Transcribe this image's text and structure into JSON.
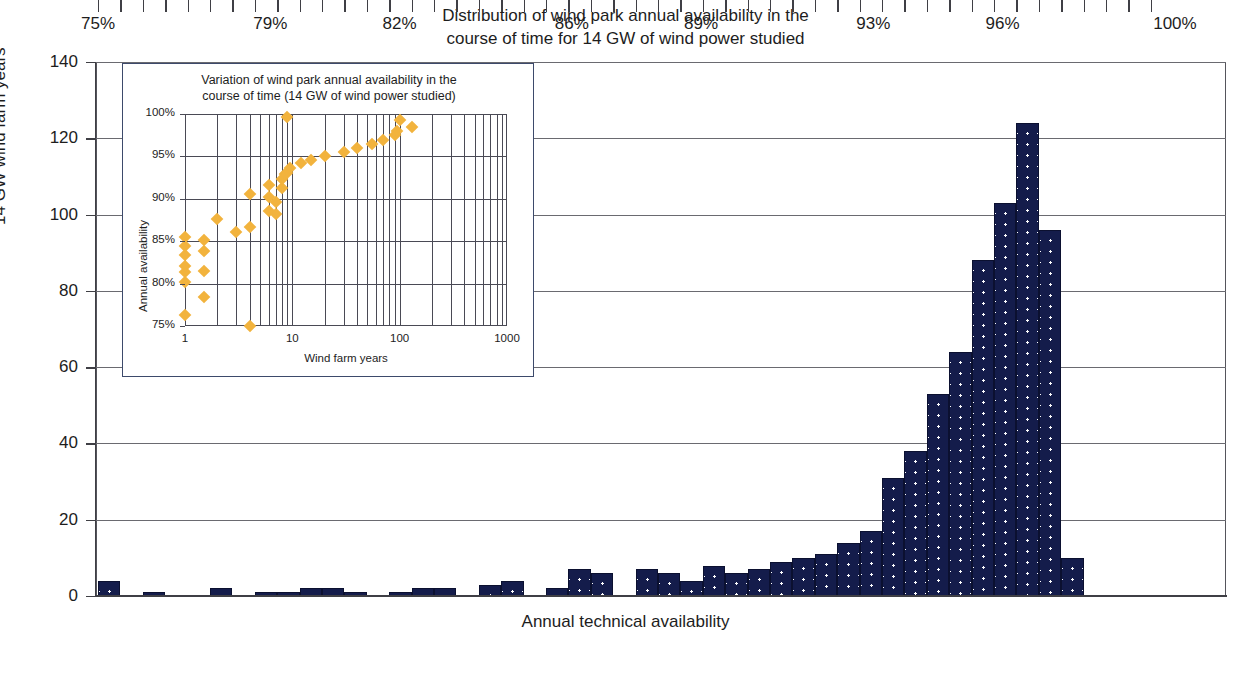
{
  "main": {
    "title_line1": "Distribution of wind park annual availability in the",
    "title_line2": "course of time for 14 GW of wind power studied",
    "y_title": "14 GW wind farm years",
    "x_title": "Annual technical availability"
  },
  "inset": {
    "title_line1": "Variation of wind park annual availability in the",
    "title_line2": "course of time (14 GW of wind power studied)",
    "y_title": "Annual availability",
    "x_title": "Wind farm years"
  },
  "colors": {
    "bar_fill": "#141c4b",
    "bar_dot": "#ffffff",
    "scatter": "#f2b33d",
    "axis": "#3f3f45",
    "inset_border": "#3d4a6b"
  },
  "chart_data": [
    {
      "type": "bar",
      "title": "Distribution of wind park annual availability in the course of time for 14 GW of wind power studied",
      "xlabel": "Annual technical availability",
      "ylabel": "14 GW wind farm years",
      "ylim": [
        0,
        140
      ],
      "ytick_labels": [
        "0",
        "20",
        "40",
        "60",
        "80",
        "100",
        "120",
        "140"
      ],
      "ytick_values": [
        0,
        20,
        40,
        60,
        80,
        100,
        120,
        140
      ],
      "xlim": [
        74.5,
        100.5
      ],
      "xtick_labels": [
        "75%",
        "79%",
        "82%",
        "86%",
        "89%",
        "93%",
        "96%",
        "100%"
      ],
      "xtick_values": [
        75,
        79,
        82,
        86,
        89,
        93,
        96,
        100
      ],
      "grid": "horizontal",
      "legend": "none",
      "bin_width_percent": 0.52,
      "categories": [
        "75%",
        "75.5%",
        "76%",
        "76.5%",
        "77%",
        "77.5%",
        "78%",
        "78.5%",
        "79%",
        "79.5%",
        "80%",
        "80.5%",
        "81%",
        "81.5%",
        "82%",
        "82.5%",
        "83%",
        "83.5%",
        "84%",
        "84.5%",
        "85%",
        "85.5%",
        "86%",
        "86.5%",
        "87%",
        "87.5%",
        "88%",
        "88.5%",
        "89%",
        "89.5%",
        "90%",
        "90.5%",
        "91%",
        "91.5%",
        "92%",
        "92.5%",
        "93%",
        "93.5%",
        "94%",
        "94.5%",
        "95%",
        "95.5%",
        "96%",
        "96.5%",
        "97%",
        "97.5%",
        "98%",
        "98.5%",
        "99%",
        "99.5%",
        "100%"
      ],
      "values": [
        4,
        0,
        1,
        0,
        0,
        2,
        0,
        1,
        1,
        2,
        2,
        1,
        0,
        1,
        2,
        2,
        0,
        3,
        4,
        0,
        2,
        7,
        6,
        0,
        7,
        6,
        4,
        8,
        6,
        7,
        9,
        10,
        11,
        14,
        17,
        31,
        38,
        53,
        64,
        88,
        103,
        124,
        96,
        10
      ],
      "n_bars": 44
    },
    {
      "type": "scatter",
      "title": "Variation of wind park annual availability in the course of time (14 GW of wind power studied)",
      "xlabel": "Wind farm years",
      "ylabel": "Annual availability",
      "xscale": "log",
      "xlim": [
        1,
        1000
      ],
      "xtick_labels": [
        "1",
        "10",
        "100",
        "1000"
      ],
      "xtick_values": [
        1,
        10,
        100,
        1000
      ],
      "ylim": [
        75,
        100
      ],
      "ytick_labels": [
        "75%",
        "80%",
        "85%",
        "90%",
        "95%",
        "100%"
      ],
      "ytick_values": [
        75,
        80,
        85,
        90,
        95,
        100
      ],
      "grid": "both",
      "legend": "none",
      "points": [
        [
          1,
          76.3
        ],
        [
          1,
          80.2
        ],
        [
          1,
          81.4
        ],
        [
          1,
          82.1
        ],
        [
          1,
          83.4
        ],
        [
          1,
          84.4
        ],
        [
          1,
          85.5
        ],
        [
          1.5,
          78.4
        ],
        [
          1.5,
          81.5
        ],
        [
          1.5,
          83.9
        ],
        [
          1.5,
          85.1
        ],
        [
          2,
          87.6
        ],
        [
          3,
          86.1
        ],
        [
          4,
          75.0
        ],
        [
          4,
          86.7
        ],
        [
          4,
          90.6
        ],
        [
          6,
          88.6
        ],
        [
          6,
          90.2
        ],
        [
          6,
          91.6
        ],
        [
          7,
          88.2
        ],
        [
          7,
          89.6
        ],
        [
          8,
          91.3
        ],
        [
          8,
          92.3
        ],
        [
          8.6,
          92.9
        ],
        [
          9,
          93.1
        ],
        [
          9,
          99.7
        ],
        [
          9.6,
          93.6
        ],
        [
          12,
          94.2
        ],
        [
          15,
          94.6
        ],
        [
          20,
          95.1
        ],
        [
          30,
          95.5
        ],
        [
          40,
          96.0
        ],
        [
          55,
          96.5
        ],
        [
          70,
          96.9
        ],
        [
          90,
          97.5
        ],
        [
          95,
          98.0
        ],
        [
          100,
          99.3
        ],
        [
          130,
          98.5
        ]
      ]
    }
  ]
}
